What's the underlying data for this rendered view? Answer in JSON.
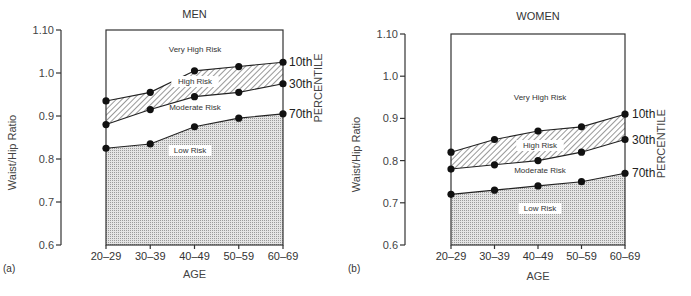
{
  "chart_data": [
    {
      "type": "area",
      "panel_label": "(a)",
      "title": "MEN",
      "xlabel": "AGE",
      "ylabel": "Waist/Hip Ratio",
      "right_axis_label": "PERCENTILE",
      "ylim": [
        0.6,
        1.1
      ],
      "yticks": [
        "0.6",
        "0.7",
        "0.8",
        "0.9",
        "1.0",
        "1.10"
      ],
      "ytick_values": [
        0.6,
        0.7,
        0.8,
        0.9,
        1.0,
        1.1
      ],
      "categories": [
        "20–29",
        "30–39",
        "40–49",
        "50–59",
        "60–69"
      ],
      "series": [
        {
          "name": "10th",
          "values": [
            0.935,
            0.955,
            1.005,
            1.015,
            1.025
          ]
        },
        {
          "name": "30th",
          "values": [
            0.88,
            0.915,
            0.945,
            0.955,
            0.975
          ]
        },
        {
          "name": "70th",
          "values": [
            0.825,
            0.835,
            0.875,
            0.895,
            0.905
          ]
        }
      ],
      "zones": [
        {
          "label": "Very High Risk",
          "region": "above 10th"
        },
        {
          "label": "High Risk",
          "region": "between 10th and 30th",
          "fill": "hatched"
        },
        {
          "label": "Moderate Risk",
          "region": "between 30th and 70th"
        },
        {
          "label": "Low Risk",
          "region": "below 70th",
          "fill": "dotted"
        }
      ],
      "grid": false
    },
    {
      "type": "area",
      "panel_label": "(b)",
      "title": "WOMEN",
      "xlabel": "AGE",
      "ylabel": "Waist/Hip Ratio",
      "right_axis_label": "PERCENTILE",
      "ylim": [
        0.6,
        1.1
      ],
      "yticks": [
        "0.6",
        "0.7",
        "0.8",
        "0.9",
        "1.0",
        "1.10"
      ],
      "ytick_values": [
        0.6,
        0.7,
        0.8,
        0.9,
        1.0,
        1.1
      ],
      "categories": [
        "20–29",
        "30–39",
        "40–49",
        "50–59",
        "60–69"
      ],
      "series": [
        {
          "name": "10th",
          "values": [
            0.82,
            0.85,
            0.87,
            0.88,
            0.91
          ]
        },
        {
          "name": "30th",
          "values": [
            0.78,
            0.79,
            0.8,
            0.82,
            0.85
          ]
        },
        {
          "name": "70th",
          "values": [
            0.72,
            0.73,
            0.74,
            0.75,
            0.77
          ]
        }
      ],
      "zones": [
        {
          "label": "Very High Risk",
          "region": "above 10th"
        },
        {
          "label": "High Risk",
          "region": "between 10th and 30th",
          "fill": "hatched"
        },
        {
          "label": "Moderate Risk",
          "region": "between 30th and 70th"
        },
        {
          "label": "Low Risk",
          "region": "below 70th",
          "fill": "dotted"
        }
      ],
      "grid": false
    }
  ]
}
